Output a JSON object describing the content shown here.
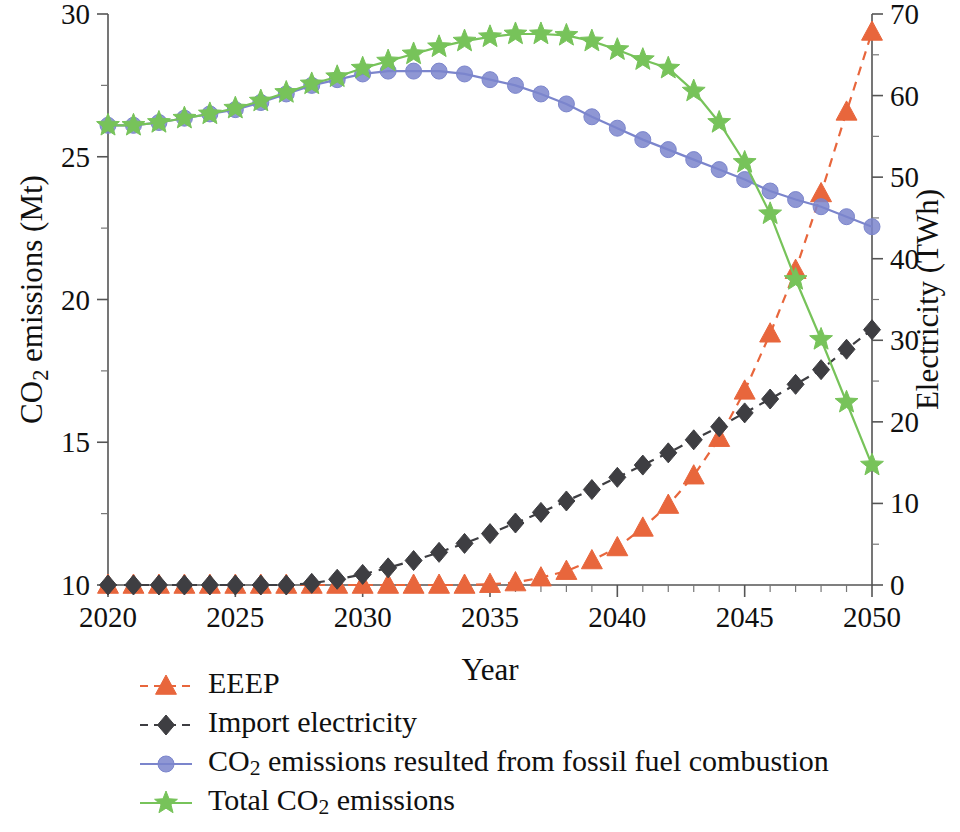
{
  "chart_data": {
    "type": "line",
    "title": "",
    "xlabel": "Year",
    "ylabel": "CO2 emissions (Mt)",
    "ylabel_parts": {
      "pre": "CO",
      "sub": "2",
      "post": " emissions (Mt)"
    },
    "y2label": "Electricity (TWh)",
    "grid": false,
    "legend_position": "below-left",
    "x": [
      2020,
      2021,
      2022,
      2023,
      2024,
      2025,
      2026,
      2027,
      2028,
      2029,
      2030,
      2031,
      2032,
      2033,
      2034,
      2035,
      2036,
      2037,
      2038,
      2039,
      2040,
      2041,
      2042,
      2043,
      2044,
      2045,
      2046,
      2047,
      2048,
      2049,
      2050
    ],
    "xlim": [
      2020,
      2050
    ],
    "xticks_major": [
      2020,
      2025,
      2030,
      2035,
      2040,
      2045,
      2050
    ],
    "xtick_labels": [
      "2020",
      "2025",
      "2030",
      "2035",
      "2040",
      "2045",
      "2050"
    ],
    "ylim": [
      10,
      30
    ],
    "yticks_major": [
      10,
      15,
      20,
      25,
      30
    ],
    "ytick_labels": [
      "10",
      "15",
      "20",
      "25",
      "30"
    ],
    "yticks_minor": [
      12.5,
      17.5,
      22.5,
      27.5
    ],
    "y2lim": [
      0,
      70
    ],
    "y2ticks_major": [
      0,
      10,
      20,
      30,
      40,
      50,
      60,
      70
    ],
    "y2tick_labels": [
      "0",
      "10",
      "20",
      "30",
      "40",
      "50",
      "60",
      "70"
    ],
    "y2ticks_minor": [
      5,
      15,
      25,
      35,
      45,
      55,
      65
    ],
    "series": [
      {
        "name": "EEEP",
        "label": "EEEP",
        "axis": "right",
        "color": "#E8663C",
        "marker": "triangle",
        "linestyle": "dashed",
        "values": [
          0.0,
          0.0,
          0.0,
          0.0,
          0.0,
          0.0,
          0.0,
          0.0,
          0.0,
          0.0,
          0.0,
          0.0,
          0.0,
          0.0,
          0.0,
          0.1,
          0.3,
          0.9,
          1.7,
          3.0,
          4.6,
          7.0,
          9.8,
          13.4,
          18.0,
          23.8,
          30.8,
          38.6,
          48.0,
          58.0,
          67.8
        ]
      },
      {
        "name": "Import electricity",
        "label": "Import electricity",
        "axis": "right",
        "color": "#3E3E42",
        "marker": "diamond",
        "linestyle": "dashed",
        "values": [
          0.0,
          0.0,
          0.0,
          0.0,
          0.0,
          0.0,
          0.0,
          0.0,
          0.2,
          0.7,
          1.3,
          2.1,
          3.0,
          4.0,
          5.1,
          6.3,
          7.6,
          8.9,
          10.3,
          11.7,
          13.2,
          14.7,
          16.2,
          17.8,
          19.4,
          21.1,
          22.8,
          24.6,
          26.4,
          28.9,
          31.3
        ]
      },
      {
        "name": "CO2 emissions resulted from fossil fuel combustion",
        "label_parts": {
          "pre": "CO",
          "sub": "2",
          "post": " emissions resulted from fossil fuel combustion"
        },
        "label": "CO2 emissions resulted from fossil fuel combustion",
        "axis": "left",
        "color": "#7B85CC",
        "marker": "circle",
        "linestyle": "solid",
        "values": [
          26.1,
          26.1,
          26.2,
          26.35,
          26.5,
          26.65,
          26.9,
          27.2,
          27.5,
          27.7,
          27.9,
          28.0,
          28.0,
          28.0,
          27.9,
          27.7,
          27.5,
          27.2,
          26.85,
          26.4,
          26.0,
          25.6,
          25.25,
          24.9,
          24.55,
          24.2,
          23.8,
          23.5,
          23.25,
          22.9,
          22.55
        ]
      },
      {
        "name": "Total CO2 emissions",
        "label_parts": {
          "pre": "Total CO",
          "sub": "2",
          "post": " emissions"
        },
        "label": "Total CO2 emissions",
        "axis": "left",
        "color": "#77C35A",
        "marker": "star",
        "linestyle": "solid",
        "values": [
          26.1,
          26.1,
          26.2,
          26.35,
          26.5,
          26.7,
          26.95,
          27.25,
          27.55,
          27.8,
          28.1,
          28.35,
          28.6,
          28.85,
          29.05,
          29.2,
          29.3,
          29.3,
          29.25,
          29.05,
          28.75,
          28.4,
          28.1,
          27.3,
          26.2,
          24.8,
          23.0,
          20.7,
          18.6,
          16.4,
          14.2
        ]
      }
    ]
  },
  "legend": {
    "items": [
      {
        "label": "EEEP",
        "color": "#E8663C",
        "marker": "triangle",
        "linestyle": "dashed"
      },
      {
        "label": "Import electricity",
        "color": "#3E3E42",
        "marker": "diamond",
        "linestyle": "dashed"
      },
      {
        "label": "CO2 emissions resulted from fossil fuel combustion",
        "color": "#7B85CC",
        "marker": "circle",
        "linestyle": "solid"
      },
      {
        "label": "Total CO2 emissions",
        "color": "#77C35A",
        "marker": "star",
        "linestyle": "solid"
      }
    ]
  }
}
